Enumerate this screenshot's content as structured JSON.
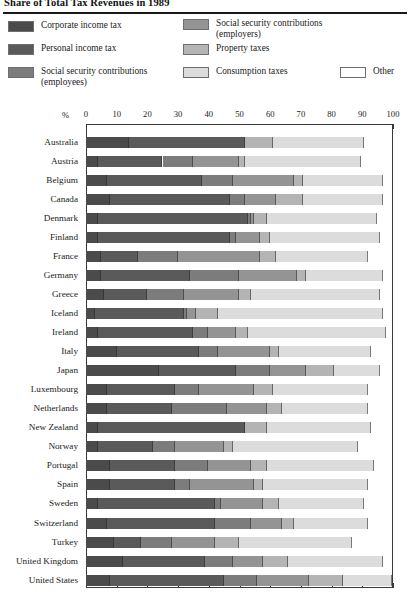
{
  "title": "Share of Total Tax Revenues in 1989",
  "legend": {
    "items": [
      {
        "key": "corporate",
        "label": "Corporate income tax",
        "color": "#4b4b4b"
      },
      {
        "key": "personal",
        "label": "Personal income tax",
        "color": "#5a5a5a"
      },
      {
        "key": "ss_employees",
        "label": "Social security contributions\n(employees)",
        "color": "#7c7c7c"
      },
      {
        "key": "ss_employers",
        "label": "Social security contributions\n(employers)",
        "color": "#949494"
      },
      {
        "key": "property",
        "label": "Property taxes",
        "color": "#b4b4b4"
      },
      {
        "key": "consumption",
        "label": "Consumption taxes",
        "color": "#dcdcdc"
      },
      {
        "key": "other",
        "label": "Other",
        "color": "#ffffff"
      }
    ]
  },
  "axis": {
    "unit_label": "%",
    "ticks": [
      0,
      10,
      20,
      30,
      40,
      50,
      60,
      70,
      80,
      90,
      100
    ],
    "tick_labels": [
      "0",
      "10",
      "20",
      "30",
      "40",
      "50",
      "60",
      "70",
      "80",
      "90",
      "100"
    ]
  },
  "chart_data": {
    "type": "bar",
    "orientation": "horizontal",
    "stacked": true,
    "stack_mode": "percent",
    "title": "Share of Total Tax Revenues in 1989",
    "xlabel": "%",
    "ylabel": "",
    "xlim": [
      0,
      100
    ],
    "grid": false,
    "legend_position": "top",
    "series": [
      {
        "name": "Corporate income tax",
        "key": "corporate",
        "color": "#4b4b4b",
        "values": [
          14,
          4,
          7,
          8,
          4,
          4,
          5,
          5,
          6,
          3,
          4,
          10,
          24,
          7,
          7,
          4,
          4,
          8,
          8,
          4,
          7,
          9,
          12,
          8
        ]
      },
      {
        "name": "Personal income tax",
        "key": "personal",
        "color": "#5a5a5a",
        "values": [
          38,
          21,
          31,
          39,
          49,
          43,
          12,
          29,
          14,
          29,
          31,
          27,
          25,
          22,
          21,
          48,
          18,
          21,
          21,
          38,
          35,
          9,
          27,
          37
        ]
      },
      {
        "name": "Social security contributions (employees)",
        "key": "ss_employees",
        "color": "#7c7c7c",
        "values": [
          0,
          10,
          10,
          5,
          1,
          2,
          13,
          16,
          12,
          1,
          5,
          6,
          11,
          8,
          18,
          0,
          7,
          11,
          5,
          2,
          12,
          10,
          9,
          11
        ]
      },
      {
        "name": "Social security contributions (employers)",
        "key": "ss_employers",
        "color": "#949494",
        "values": [
          0,
          15,
          20,
          10,
          1,
          8,
          27,
          19,
          18,
          3,
          9,
          17,
          12,
          18,
          13,
          0,
          16,
          14,
          21,
          14,
          10,
          14,
          10,
          17
        ]
      },
      {
        "name": "Property taxes",
        "key": "property",
        "color": "#b4b4b4",
        "values": [
          9,
          2,
          3,
          9,
          4,
          3,
          5,
          3,
          4,
          7,
          4,
          3,
          9,
          6,
          5,
          7,
          3,
          5,
          3,
          5,
          4,
          8,
          8,
          11
        ]
      },
      {
        "name": "Consumption taxes",
        "key": "consumption",
        "color": "#dcdcdc",
        "values": [
          30,
          38,
          26,
          26,
          36,
          36,
          30,
          25,
          42,
          54,
          45,
          30,
          15,
          31,
          28,
          34,
          41,
          35,
          34,
          28,
          24,
          37,
          31,
          16
        ]
      },
      {
        "name": "Other",
        "key": "other",
        "color": "#ffffff",
        "values": [
          9,
          10,
          3,
          3,
          5,
          4,
          8,
          3,
          4,
          3,
          2,
          7,
          4,
          8,
          8,
          7,
          11,
          6,
          8,
          9,
          8,
          13,
          3,
          0
        ]
      }
    ],
    "categories": [
      "Australia",
      "Austria",
      "Belgium",
      "Canada",
      "Denmark",
      "Finland",
      "France",
      "Germany",
      "Greece",
      "Iceland",
      "Ireland",
      "Italy",
      "Japan",
      "Luxembourg",
      "Netherlands",
      "New Zealand",
      "Norway",
      "Portugal",
      "Spain",
      "Sweden",
      "Switzerland",
      "Turkey",
      "United Kingdom",
      "United States"
    ]
  }
}
